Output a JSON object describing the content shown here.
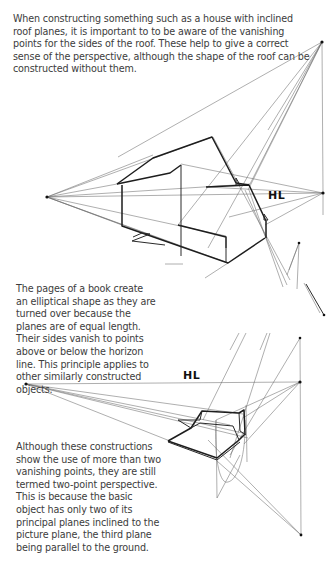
{
  "paragraphs": {
    "intro": "When constructing something such as a house with inclined roof planes, it is important to to be aware of the vanishing points for the sides of the roof. These help to give a correct sense of the perspective, although the shape of the roof can be constructed without them.",
    "book": "The pages of a book create an elliptical shape as they are turned over because the planes are of equal length. Their sides vanish to points above or below the horizon line. This principle applies to other similarly constructed objects.",
    "two_point": "Although these constructions show the use of more than two vanishing points, they are still termed two-point perspective. This is because the basic object has only two of its principal planes inclined to the picture plane, the third plane being parallel to the ground."
  },
  "figures": {
    "house": {
      "horizon_label": "HL"
    },
    "book": {
      "horizon_label": "HL"
    }
  }
}
